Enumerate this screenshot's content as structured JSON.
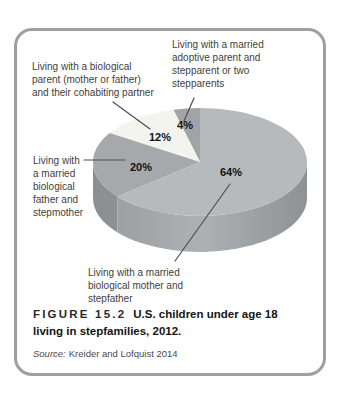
{
  "figure": {
    "caption_tag": "FIGURE 15.2",
    "caption_text": "U.S. children under age 18 living in stepfamilies, 2012.",
    "source_prefix": "Source:",
    "source_text": "Kreider and Lofquist 2014",
    "border_color": "#9da0a2"
  },
  "labels": {
    "adoptive": {
      "lines": [
        "Living with a married",
        "adoptive parent and",
        "stepparent or two",
        "stepparents"
      ]
    },
    "cohabiting": {
      "lines": [
        "Living with a biological",
        "parent (mother or father)",
        "and their cohabiting partner"
      ]
    },
    "father": {
      "lines": [
        "Living with",
        "a married",
        "biological",
        "father and",
        "stepmother"
      ]
    },
    "mother": {
      "lines": [
        "Living with a married",
        "biological mother and",
        "stepfather"
      ]
    }
  },
  "chart_data": {
    "type": "pie",
    "style": "3d",
    "title": "U.S. children under age 18 living in stepfamilies, 2012",
    "unit": "percent",
    "start_angle_deg": 90,
    "direction": "counterclockwise",
    "slices": [
      {
        "category": "Living with a married adoptive parent and stepparent or two stepparents",
        "value": 4,
        "display": "4%",
        "color": "#a0a4a7"
      },
      {
        "category": "Living with a biological parent (mother or father) and their cohabiting partner",
        "value": 12,
        "display": "12%",
        "color": "#f4f4ef"
      },
      {
        "category": "Living with a married biological father and stepmother",
        "value": 20,
        "display": "20%",
        "color": "#a6a9ac",
        "rim_color": "#8d9093"
      },
      {
        "category": "Living with a married biological mother and stepfather",
        "value": 64,
        "display": "64%",
        "color": "#b7babc",
        "rim_gradient": [
          "#9ea1a4",
          "#aeb1b4",
          "#8f9295"
        ]
      }
    ],
    "layout": {
      "cx": 200,
      "cy": 162,
      "rx": 107,
      "ry": 54,
      "depth": 36,
      "rim_visible_deg": [
        180,
        360
      ],
      "pct_label_pos": [
        [
          185,
          129
        ],
        [
          160,
          141
        ],
        [
          141,
          171
        ],
        [
          231,
          176
        ]
      ],
      "leaders": [
        {
          "from": [
            194,
            98
          ],
          "to": [
            184,
            121
          ]
        },
        {
          "from": [
            113,
            102
          ],
          "to": [
            150,
            129
          ]
        },
        {
          "from": [
            84,
            160
          ],
          "to": [
            125,
            160
          ]
        },
        {
          "from": [
            175,
            261
          ],
          "to": [
            230,
            184
          ]
        }
      ],
      "leader_color": "#4d4f50",
      "pct_label_color": "#121212"
    }
  }
}
